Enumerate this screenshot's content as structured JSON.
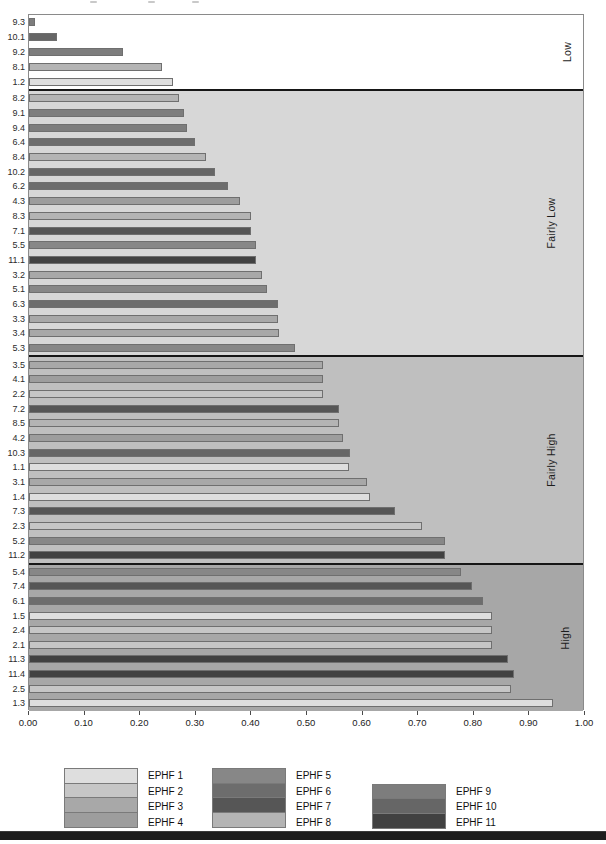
{
  "chart_data": {
    "type": "bar",
    "orientation": "horizontal",
    "title": "",
    "xlabel": "",
    "ylabel": "",
    "xlim": [
      0,
      1
    ],
    "x_ticks": [
      "0.00",
      "0.10",
      "0.20",
      "0.30",
      "0.40",
      "0.50",
      "0.60",
      "0.70",
      "0.80",
      "0.90",
      "1.00"
    ],
    "grid": false,
    "legend_position": "bottom",
    "series_colors": {
      "1": "#dedede",
      "2": "#c6c6c6",
      "3": "#a8a8a8",
      "4": "#9d9d9d",
      "5": "#878787",
      "6": "#6d6d6d",
      "7": "#565656",
      "8": "#b4b4b4",
      "9": "#7d7d7d",
      "10": "#666666",
      "11": "#414141"
    },
    "sections": [
      {
        "name": "Low",
        "background": "#ffffff",
        "bars": [
          {
            "label": "9.3",
            "series": "9",
            "value": 0.01
          },
          {
            "label": "10.1",
            "series": "10",
            "value": 0.05
          },
          {
            "label": "9.2",
            "series": "9",
            "value": 0.17
          },
          {
            "label": "8.1",
            "series": "8",
            "value": 0.24
          },
          {
            "label": "1.2",
            "series": "1",
            "value": 0.26
          }
        ]
      },
      {
        "name": "Fairly Low",
        "background": "#d7d7d7",
        "bars": [
          {
            "label": "8.2",
            "series": "8",
            "value": 0.27
          },
          {
            "label": "9.1",
            "series": "9",
            "value": 0.28
          },
          {
            "label": "9.4",
            "series": "9",
            "value": 0.285
          },
          {
            "label": "6.4",
            "series": "6",
            "value": 0.3
          },
          {
            "label": "8.4",
            "series": "8",
            "value": 0.32
          },
          {
            "label": "10.2",
            "series": "10",
            "value": 0.335
          },
          {
            "label": "6.2",
            "series": "6",
            "value": 0.36
          },
          {
            "label": "4.3",
            "series": "4",
            "value": 0.38
          },
          {
            "label": "8.3",
            "series": "8",
            "value": 0.4
          },
          {
            "label": "7.1",
            "series": "7",
            "value": 0.4
          },
          {
            "label": "5.5",
            "series": "5",
            "value": 0.41
          },
          {
            "label": "11.1",
            "series": "11",
            "value": 0.41
          },
          {
            "label": "3.2",
            "series": "3",
            "value": 0.42
          },
          {
            "label": "5.1",
            "series": "5",
            "value": 0.43
          },
          {
            "label": "6.3",
            "series": "6",
            "value": 0.45
          },
          {
            "label": "3.3",
            "series": "3",
            "value": 0.45
          },
          {
            "label": "3.4",
            "series": "3",
            "value": 0.452
          },
          {
            "label": "5.3",
            "series": "5",
            "value": 0.48
          }
        ]
      },
      {
        "name": "Fairly High",
        "background": "#bfbfbf",
        "bars": [
          {
            "label": "3.5",
            "series": "3",
            "value": 0.53
          },
          {
            "label": "4.1",
            "series": "4",
            "value": 0.53
          },
          {
            "label": "2.2",
            "series": "2",
            "value": 0.53
          },
          {
            "label": "7.2",
            "series": "7",
            "value": 0.56
          },
          {
            "label": "8.5",
            "series": "8",
            "value": 0.56
          },
          {
            "label": "4.2",
            "series": "4",
            "value": 0.567
          },
          {
            "label": "10.3",
            "series": "10",
            "value": 0.58
          },
          {
            "label": "1.1",
            "series": "1",
            "value": 0.578
          },
          {
            "label": "3.1",
            "series": "3",
            "value": 0.61
          },
          {
            "label": "1.4",
            "series": "1",
            "value": 0.615
          },
          {
            "label": "7.3",
            "series": "7",
            "value": 0.66
          },
          {
            "label": "2.3",
            "series": "2",
            "value": 0.71
          },
          {
            "label": "5.2",
            "series": "5",
            "value": 0.75
          },
          {
            "label": "11.2",
            "series": "11",
            "value": 0.75
          }
        ]
      },
      {
        "name": "High",
        "background": "#a7a7a7",
        "bars": [
          {
            "label": "5.4",
            "series": "5",
            "value": 0.78
          },
          {
            "label": "7.4",
            "series": "7",
            "value": 0.8
          },
          {
            "label": "6.1",
            "series": "6",
            "value": 0.82
          },
          {
            "label": "1.5",
            "series": "1",
            "value": 0.835
          },
          {
            "label": "2.4",
            "series": "2",
            "value": 0.835
          },
          {
            "label": "2.1",
            "series": "2",
            "value": 0.835
          },
          {
            "label": "11.3",
            "series": "11",
            "value": 0.865
          },
          {
            "label": "11.4",
            "series": "11",
            "value": 0.875
          },
          {
            "label": "2.5",
            "series": "2",
            "value": 0.87
          },
          {
            "label": "1.3",
            "series": "1",
            "value": 0.945
          }
        ]
      }
    ],
    "legend": [
      {
        "name": "EPHF 1",
        "color": "#dedede"
      },
      {
        "name": "EPHF 2",
        "color": "#c6c6c6"
      },
      {
        "name": "EPHF 3",
        "color": "#a8a8a8"
      },
      {
        "name": "EPHF 4",
        "color": "#9d9d9d"
      },
      {
        "name": "EPHF 5",
        "color": "#878787"
      },
      {
        "name": "EPHF 6",
        "color": "#6d6d6d"
      },
      {
        "name": "EPHF 7",
        "color": "#565656"
      },
      {
        "name": "EPHF 8",
        "color": "#b4b4b4"
      },
      {
        "name": "EPHF 9",
        "color": "#7d7d7d"
      },
      {
        "name": "EPHF 10",
        "color": "#666666"
      },
      {
        "name": "EPHF 11",
        "color": "#414141"
      }
    ],
    "legend_columns": [
      [
        0,
        1,
        2,
        3
      ],
      [
        4,
        5,
        6,
        7
      ],
      [
        8,
        9,
        10
      ]
    ],
    "row_height_px": 14.8
  }
}
